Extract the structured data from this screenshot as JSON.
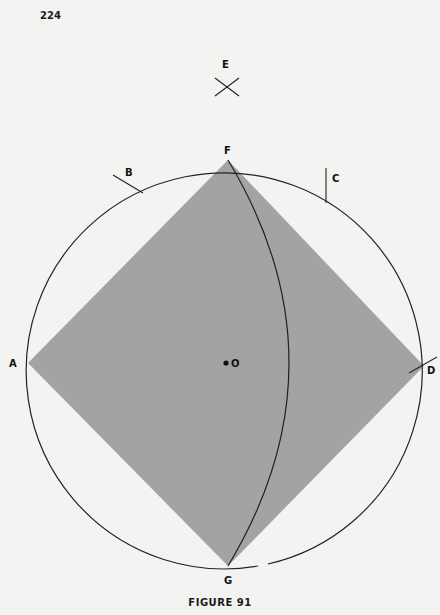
{
  "page": {
    "number": "224",
    "caption": "FIGURE 91"
  },
  "figure": {
    "circle": {
      "cx": 226,
      "cy": 363,
      "r": 198,
      "stroke": "#222222"
    },
    "square_fill": "#a3a3a3",
    "points": {
      "A": {
        "label": "A",
        "x": 28,
        "y": 363
      },
      "B": {
        "label": "B",
        "x": 128,
        "y": 177
      },
      "C": {
        "label": "C",
        "x": 326,
        "y": 183
      },
      "D": {
        "label": "D",
        "x": 424,
        "y": 366
      },
      "E": {
        "label": "E",
        "x": 226,
        "y": 70
      },
      "F": {
        "label": "F",
        "x": 228,
        "y": 160
      },
      "G": {
        "label": "G",
        "x": 228,
        "y": 566
      },
      "O": {
        "label": "O",
        "x": 226,
        "y": 363
      }
    }
  }
}
